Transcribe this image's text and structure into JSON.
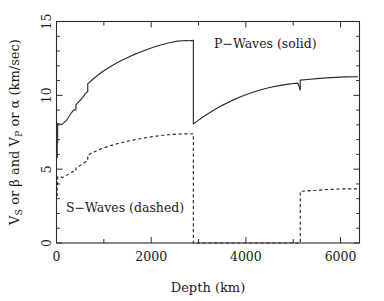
{
  "chart_data": {
    "type": "line",
    "title": "",
    "xlabel": "Depth (km)",
    "ylabel": "V_S or β and V_P or α (km/sec)",
    "ylabel_parts": {
      "v1": "V",
      "v1_sub": "S",
      "mid1": " or β and V",
      "v2_sub": "P",
      "mid2": " or α (km/sec)"
    },
    "xlim": [
      0,
      6400
    ],
    "ylim": [
      0,
      15
    ],
    "xticks": [
      0,
      2000,
      4000,
      6000
    ],
    "xticks_all": [
      0,
      1000,
      2000,
      3000,
      4000,
      5000,
      6000
    ],
    "xtick_labels": [
      "0",
      "2000",
      "4000",
      "6000"
    ],
    "yticks": [
      0,
      5,
      10,
      15
    ],
    "ytick_labels": [
      "0",
      "5",
      "10",
      "15"
    ],
    "yticks_minor": [
      1,
      2,
      3,
      4,
      6,
      7,
      8,
      9,
      11,
      12,
      13,
      14
    ],
    "grid": false,
    "legend_position": "inside-plot",
    "annotations": [
      {
        "name": "p-waves-legend",
        "text": "P−Waves (solid)",
        "x": 3200,
        "y": 13.4
      },
      {
        "name": "s-waves-legend",
        "text": "S−Waves (dashed)",
        "x": 450,
        "y": 2.6
      }
    ],
    "series": [
      {
        "name": "P−Waves (solid)",
        "symbol": "V_P or α",
        "style": "solid",
        "color": "#2b2b2b",
        "points": [
          [
            0,
            5.8
          ],
          [
            15,
            5.8
          ],
          [
            15,
            6.8
          ],
          [
            24,
            6.8
          ],
          [
            24,
            8.11
          ],
          [
            40,
            8.08
          ],
          [
            80,
            8.05
          ],
          [
            120,
            8.03
          ],
          [
            165,
            8.17
          ],
          [
            210,
            8.3
          ],
          [
            260,
            8.55
          ],
          [
            310,
            8.8
          ],
          [
            360,
            9.0
          ],
          [
            410,
            9.03
          ],
          [
            410,
            9.36
          ],
          [
            460,
            9.53
          ],
          [
            510,
            9.7
          ],
          [
            560,
            9.9
          ],
          [
            610,
            10.12
          ],
          [
            660,
            10.26
          ],
          [
            660,
            10.79
          ],
          [
            710,
            10.91
          ],
          [
            760,
            11.07
          ],
          [
            860,
            11.33
          ],
          [
            960,
            11.58
          ],
          [
            1060,
            11.79
          ],
          [
            1160,
            11.98
          ],
          [
            1260,
            12.17
          ],
          [
            1360,
            12.34
          ],
          [
            1460,
            12.5
          ],
          [
            1560,
            12.65
          ],
          [
            1660,
            12.79
          ],
          [
            1760,
            12.92
          ],
          [
            1860,
            13.04
          ],
          [
            1960,
            13.16
          ],
          [
            2060,
            13.27
          ],
          [
            2160,
            13.37
          ],
          [
            2260,
            13.46
          ],
          [
            2360,
            13.54
          ],
          [
            2460,
            13.61
          ],
          [
            2560,
            13.67
          ],
          [
            2660,
            13.7
          ],
          [
            2740,
            13.71
          ],
          [
            2800,
            13.7
          ],
          [
            2891,
            13.72
          ],
          [
            2891,
            8.06
          ],
          [
            2950,
            8.2
          ],
          [
            3100,
            8.55
          ],
          [
            3300,
            8.96
          ],
          [
            3500,
            9.32
          ],
          [
            3700,
            9.64
          ],
          [
            3900,
            9.92
          ],
          [
            4100,
            10.16
          ],
          [
            4300,
            10.36
          ],
          [
            4500,
            10.53
          ],
          [
            4700,
            10.66
          ],
          [
            4900,
            10.76
          ],
          [
            5000,
            10.8
          ],
          [
            5100,
            10.83
          ],
          [
            5149,
            10.36
          ],
          [
            5149,
            11.03
          ],
          [
            5300,
            11.07
          ],
          [
            5500,
            11.13
          ],
          [
            5700,
            11.18
          ],
          [
            5900,
            11.22
          ],
          [
            6100,
            11.25
          ],
          [
            6371,
            11.26
          ]
        ]
      },
      {
        "name": "S−Waves (dashed)",
        "symbol": "V_S or β",
        "style": "dashed",
        "color": "#2b2b2b",
        "points": [
          [
            0,
            3.2
          ],
          [
            15,
            3.2
          ],
          [
            15,
            3.9
          ],
          [
            24,
            3.9
          ],
          [
            24,
            4.49
          ],
          [
            40,
            4.48
          ],
          [
            80,
            4.46
          ],
          [
            120,
            4.44
          ],
          [
            165,
            4.51
          ],
          [
            210,
            4.58
          ],
          [
            260,
            4.68
          ],
          [
            310,
            4.78
          ],
          [
            360,
            4.85
          ],
          [
            410,
            4.87
          ],
          [
            410,
            5.08
          ],
          [
            460,
            5.18
          ],
          [
            510,
            5.27
          ],
          [
            560,
            5.38
          ],
          [
            610,
            5.49
          ],
          [
            660,
            5.57
          ],
          [
            660,
            5.96
          ],
          [
            710,
            6.03
          ],
          [
            760,
            6.12
          ],
          [
            860,
            6.27
          ],
          [
            960,
            6.4
          ],
          [
            1060,
            6.51
          ],
          [
            1160,
            6.61
          ],
          [
            1260,
            6.7
          ],
          [
            1360,
            6.78
          ],
          [
            1460,
            6.86
          ],
          [
            1560,
            6.93
          ],
          [
            1660,
            7.0
          ],
          [
            1760,
            7.06
          ],
          [
            1860,
            7.12
          ],
          [
            1960,
            7.17
          ],
          [
            2060,
            7.22
          ],
          [
            2160,
            7.26
          ],
          [
            2260,
            7.3
          ],
          [
            2360,
            7.33
          ],
          [
            2460,
            7.36
          ],
          [
            2560,
            7.38
          ],
          [
            2660,
            7.39
          ],
          [
            2740,
            7.39
          ],
          [
            2800,
            7.38
          ],
          [
            2891,
            7.4
          ],
          [
            2891,
            0.0
          ],
          [
            5149,
            0.0
          ],
          [
            5149,
            3.5
          ],
          [
            5400,
            3.55
          ],
          [
            5700,
            3.62
          ],
          [
            6000,
            3.66
          ],
          [
            6371,
            3.67
          ]
        ]
      }
    ]
  }
}
